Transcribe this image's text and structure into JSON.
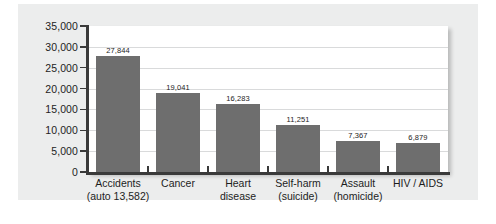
{
  "chart_data": {
    "type": "bar",
    "title": "",
    "subtitle": "",
    "xlabel": "",
    "ylabel": "",
    "ylim": [
      0,
      35000
    ],
    "grid": true,
    "legend": "none",
    "orientation": "vertical",
    "bar_color": "#6e6e6e",
    "panel_color": "#eceded",
    "plot_background": "#ffffff",
    "gridline_color": "#d9dadb",
    "axis_color": "#3a3a3a",
    "y_ticks": [
      "35,000",
      "30,000",
      "25,000",
      "20,000",
      "15,000",
      "10,000",
      "5,000",
      "0"
    ],
    "y_tick_values": [
      35000,
      30000,
      25000,
      20000,
      15000,
      10000,
      5000,
      0
    ],
    "categories": [
      "Accidents",
      "Cancer",
      "Heart disease",
      "Self-harm (suicide)",
      "Assault (homicide)",
      "HIV / AIDS"
    ],
    "category_labels": [
      {
        "line1": "Accidents",
        "line2": "(auto 13,582)"
      },
      {
        "line1": "Cancer",
        "line2": ""
      },
      {
        "line1": "Heart",
        "line2": "disease"
      },
      {
        "line1": "Self-harm",
        "line2": "(suicide)"
      },
      {
        "line1": "Assault",
        "line2": "(homicide)"
      },
      {
        "line1": "HIV / AIDS",
        "line2": ""
      }
    ],
    "values": [
      27844,
      19041,
      16283,
      11251,
      7367,
      6879
    ],
    "value_labels": [
      "27,844",
      "19,041",
      "16,283",
      "11,251",
      "7,367",
      "6,879"
    ]
  }
}
